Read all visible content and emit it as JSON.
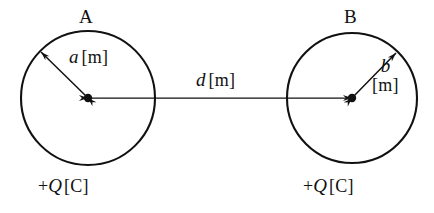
{
  "figure": {
    "type": "physics-diagram",
    "background_color": "#ffffff",
    "stroke_color": "#111111",
    "spheres": [
      {
        "id": "A",
        "name_label": "A",
        "radius_symbol": "a",
        "radius_unit": "[m]",
        "charge_label": "+Q",
        "charge_unit": "[C]",
        "center_px": [
          88,
          98
        ],
        "radius_px": 67
      },
      {
        "id": "B",
        "name_label": "B",
        "radius_symbol": "b",
        "radius_unit": "[m]",
        "charge_label": "+Q",
        "charge_unit": "[C]",
        "center_px": [
          352,
          98
        ],
        "radius_px": 65
      }
    ],
    "separation": {
      "symbol": "d",
      "unit": "[m]",
      "label_position": "above-center",
      "arrow": "double-headed"
    }
  }
}
